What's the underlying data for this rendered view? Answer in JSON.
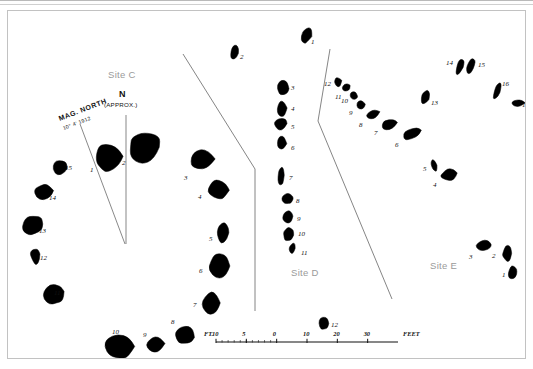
{
  "plate": {
    "title": "Archaeological stone circle and alignment survey plan",
    "ink_color": "#000000",
    "label_color": "#9a9a9a",
    "border_color": "#c2c2c2"
  },
  "site_labels": [
    {
      "name": "site-c",
      "text": "Site C",
      "x": 100,
      "y": 58
    },
    {
      "name": "site-d",
      "text": "Site D",
      "x": 283,
      "y": 256
    },
    {
      "name": "site-e",
      "text": "Site E",
      "x": 422,
      "y": 249
    }
  ],
  "north_arrows": {
    "magnetic": {
      "label": "MAG. NORTH",
      "bearing": "10° 4' 1912",
      "tip_x": 72,
      "tip_y": 113,
      "base_x": 117,
      "base_y": 233
    },
    "true": {
      "label": "N",
      "sublabel": "(APPROX.)",
      "tip_x": 118,
      "tip_y": 104,
      "base_x": 118,
      "base_y": 233
    }
  },
  "scale_bar": {
    "prefix": "FT.",
    "suffix": "FEET",
    "ticks": [
      "10",
      "5",
      "0",
      "10",
      "20",
      "30"
    ],
    "x": 208,
    "y": 331,
    "width": 182
  },
  "survey_lines": [
    {
      "name": "line-west",
      "points": "175,43 247,158 247,300"
    },
    {
      "name": "line-east",
      "points": "322,38 310,110 384,288"
    }
  ],
  "chart_data": {
    "type": "scatter",
    "sites": [
      {
        "site": "Site C",
        "shape": "circle",
        "stones": [
          {
            "id": "1",
            "x": 85,
            "y": 130,
            "w": 30,
            "h": 33,
            "rot": -8,
            "form": "blob-a",
            "lx": 82,
            "ly": 155
          },
          {
            "id": "2",
            "x": 118,
            "y": 118,
            "w": 38,
            "h": 36,
            "rot": 4,
            "form": "blob-b",
            "lx": 114,
            "ly": 148
          },
          {
            "id": "3",
            "x": 180,
            "y": 137,
            "w": 27,
            "h": 23,
            "rot": -6,
            "form": "blob-c",
            "lx": 176,
            "ly": 163
          },
          {
            "id": "4",
            "x": 199,
            "y": 168,
            "w": 22,
            "h": 22,
            "rot": 2,
            "form": "blob-d",
            "lx": 190,
            "ly": 182
          },
          {
            "id": "5",
            "x": 208,
            "y": 210,
            "w": 14,
            "h": 23,
            "rot": 6,
            "form": "blob-e",
            "lx": 201,
            "ly": 224
          },
          {
            "id": "6",
            "x": 199,
            "y": 241,
            "w": 25,
            "h": 28,
            "rot": -3,
            "form": "blob-f",
            "lx": 191,
            "ly": 256
          },
          {
            "id": "7",
            "x": 193,
            "y": 280,
            "w": 20,
            "h": 25,
            "rot": -2,
            "form": "blob-g",
            "lx": 185,
            "ly": 290
          },
          {
            "id": "8",
            "x": 166,
            "y": 313,
            "w": 22,
            "h": 22,
            "rot": 12,
            "form": "blob-h",
            "lx": 163,
            "ly": 307
          },
          {
            "id": "9",
            "x": 138,
            "y": 325,
            "w": 19,
            "h": 17,
            "rot": -4,
            "form": "blob-i",
            "lx": 135,
            "ly": 320
          },
          {
            "id": "10",
            "x": 95,
            "y": 320,
            "w": 33,
            "h": 31,
            "rot": -3,
            "form": "blob-j",
            "lx": 104,
            "ly": 317
          },
          {
            "id": "11",
            "x": 34,
            "y": 272,
            "w": 25,
            "h": 23,
            "rot": -18,
            "form": "blob-k",
            "lx": 46,
            "ly": 278
          },
          {
            "id": "12",
            "x": 22,
            "y": 236,
            "w": 11,
            "h": 18,
            "rot": -8,
            "form": "blob-l",
            "lx": 32,
            "ly": 243
          },
          {
            "id": "13",
            "x": 13,
            "y": 203,
            "w": 24,
            "h": 22,
            "rot": -8,
            "form": "blob-m",
            "lx": 31,
            "ly": 216
          },
          {
            "id": "14",
            "x": 25,
            "y": 172,
            "w": 21,
            "h": 18,
            "rot": -6,
            "form": "blob-n",
            "lx": 41,
            "ly": 183
          },
          {
            "id": "15",
            "x": 42,
            "y": 147,
            "w": 19,
            "h": 18,
            "rot": 8,
            "form": "blob-o",
            "lx": 57,
            "ly": 153
          }
        ]
      },
      {
        "site": "Site D",
        "shape": "alignment",
        "stones": [
          {
            "id": "1",
            "x": 293,
            "y": 14,
            "w": 11,
            "h": 21,
            "rot": 24,
            "form": "blob-p",
            "lx": 303,
            "ly": 27
          },
          {
            "id": "2",
            "x": 222,
            "y": 33,
            "w": 9,
            "h": 17,
            "rot": 10,
            "form": "blob-q",
            "lx": 232,
            "ly": 42
          },
          {
            "id": "3",
            "x": 268,
            "y": 68,
            "w": 14,
            "h": 18,
            "rot": 0,
            "form": "blob-r",
            "lx": 283,
            "ly": 73
          },
          {
            "id": "4",
            "x": 269,
            "y": 88,
            "w": 10,
            "h": 19,
            "rot": 0,
            "form": "blob-s",
            "lx": 283,
            "ly": 94
          },
          {
            "id": "5",
            "x": 265,
            "y": 106,
            "w": 16,
            "h": 14,
            "rot": 0,
            "form": "blob-t",
            "lx": 283,
            "ly": 112
          },
          {
            "id": "6",
            "x": 268,
            "y": 124,
            "w": 11,
            "h": 16,
            "rot": 0,
            "form": "blob-u",
            "lx": 283,
            "ly": 133
          },
          {
            "id": "7",
            "x": 269,
            "y": 155,
            "w": 8,
            "h": 21,
            "rot": 2,
            "form": "blob-v",
            "lx": 281,
            "ly": 163
          },
          {
            "id": "8",
            "x": 273,
            "y": 182,
            "w": 13,
            "h": 12,
            "rot": 0,
            "form": "blob-w",
            "lx": 288,
            "ly": 186
          },
          {
            "id": "9",
            "x": 274,
            "y": 199,
            "w": 12,
            "h": 14,
            "rot": 0,
            "form": "blob-x",
            "lx": 289,
            "ly": 204
          },
          {
            "id": "10",
            "x": 275,
            "y": 215,
            "w": 11,
            "h": 16,
            "rot": 6,
            "form": "blob-y",
            "lx": 290,
            "ly": 219
          },
          {
            "id": "11",
            "x": 281,
            "y": 231,
            "w": 7,
            "h": 13,
            "rot": 12,
            "form": "blob-z",
            "lx": 293,
            "ly": 238
          },
          {
            "id": "12",
            "x": 310,
            "y": 305,
            "w": 12,
            "h": 15,
            "rot": 0,
            "form": "blob-aa",
            "lx": 323,
            "ly": 310
          }
        ]
      },
      {
        "site": "Site E",
        "shape": "alignment",
        "stones": [
          {
            "id": "1",
            "x": 499,
            "y": 253,
            "w": 11,
            "h": 17,
            "rot": 8,
            "form": "blob-ab",
            "lx": 494,
            "ly": 260
          },
          {
            "id": "2",
            "x": 494,
            "y": 233,
            "w": 11,
            "h": 19,
            "rot": 0,
            "form": "blob-ac",
            "lx": 484,
            "ly": 241
          },
          {
            "id": "3",
            "x": 467,
            "y": 229,
            "w": 18,
            "h": 11,
            "rot": -16,
            "form": "blob-ad",
            "lx": 461,
            "ly": 242
          },
          {
            "id": "4",
            "x": 432,
            "y": 157,
            "w": 19,
            "h": 13,
            "rot": -18,
            "form": "blob-ae",
            "lx": 425,
            "ly": 170
          },
          {
            "id": "5",
            "x": 423,
            "y": 147,
            "w": 6,
            "h": 14,
            "rot": -18,
            "form": "blob-af",
            "lx": 415,
            "ly": 154
          },
          {
            "id": "6",
            "x": 393,
            "y": 117,
            "w": 22,
            "h": 12,
            "rot": -22,
            "form": "blob-ag",
            "lx": 387,
            "ly": 130
          },
          {
            "id": "7",
            "x": 372,
            "y": 107,
            "w": 18,
            "h": 13,
            "rot": -20,
            "form": "blob-ah",
            "lx": 366,
            "ly": 118
          },
          {
            "id": "8",
            "x": 357,
            "y": 99,
            "w": 16,
            "h": 9,
            "rot": -22,
            "form": "blob-ai",
            "lx": 351,
            "ly": 110
          },
          {
            "id": "9",
            "x": 348,
            "y": 88,
            "w": 10,
            "h": 11,
            "rot": -20,
            "form": "blob-aj",
            "lx": 341,
            "ly": 98
          },
          {
            "id": "10",
            "x": 342,
            "y": 80,
            "w": 8,
            "h": 9,
            "rot": -20,
            "form": "blob-ak",
            "lx": 333,
            "ly": 86
          },
          {
            "id": "11",
            "x": 334,
            "y": 72,
            "w": 9,
            "h": 9,
            "rot": -20,
            "form": "blob-al",
            "lx": 327,
            "ly": 82
          },
          {
            "id": "12",
            "x": 326,
            "y": 66,
            "w": 8,
            "h": 10,
            "rot": -20,
            "form": "blob-am",
            "lx": 316,
            "ly": 69
          },
          {
            "id": "13",
            "x": 413,
            "y": 78,
            "w": 9,
            "h": 16,
            "rot": 20,
            "form": "blob-an",
            "lx": 423,
            "ly": 88
          },
          {
            "id": "14",
            "x": 448,
            "y": 46,
            "w": 8,
            "h": 19,
            "rot": 18,
            "form": "blob-ao",
            "lx": 438,
            "ly": 48
          },
          {
            "id": "15",
            "x": 459,
            "y": 45,
            "w": 8,
            "h": 20,
            "rot": 18,
            "form": "blob-ap",
            "lx": 470,
            "ly": 50
          },
          {
            "id": "16",
            "x": 486,
            "y": 70,
            "w": 7,
            "h": 19,
            "rot": 20,
            "form": "blob-aq",
            "lx": 494,
            "ly": 69
          },
          {
            "id": "17",
            "x": 503,
            "y": 88,
            "w": 14,
            "h": 8,
            "rot": -6,
            "form": "blob-ar",
            "lx": 514,
            "ly": 90
          }
        ]
      }
    ]
  }
}
